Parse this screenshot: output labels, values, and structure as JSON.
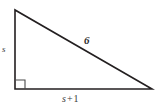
{
  "figure": {
    "type": "right-triangle-diagram",
    "background_color": "#ffffff",
    "stroke_color": "#231f20",
    "label_color": "#3a3a3a",
    "vertices": {
      "top": [
        15,
        10
      ],
      "bottom_left": [
        15,
        89
      ],
      "bottom_right": [
        152,
        89
      ]
    },
    "right_angle": {
      "at": "bottom-left",
      "marker_size": 9
    },
    "labels": {
      "vertical_leg": "s",
      "base_leg_variable": "s",
      "base_leg_operator": "+",
      "base_leg_constant": "1",
      "base_leg_full": "s + 1",
      "hypotenuse": "6"
    }
  }
}
